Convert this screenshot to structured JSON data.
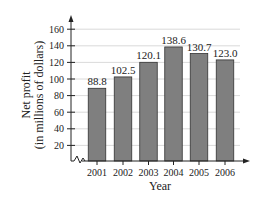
{
  "chart_data": {
    "type": "bar",
    "title": "",
    "xlabel": "Year",
    "ylabel": "Net profit (in millions of dollars)",
    "ylabel_lines": [
      "Net profit",
      "(in millions of dollars)"
    ],
    "categories": [
      "2001",
      "2002",
      "2003",
      "2004",
      "2005",
      "2006"
    ],
    "values": [
      88.8,
      102.5,
      120.1,
      138.6,
      130.7,
      123.0
    ],
    "value_labels": [
      "88.8",
      "102.5",
      "120.1",
      "138.6",
      "130.7",
      "123.0"
    ],
    "yticks": [
      20,
      40,
      60,
      80,
      100,
      120,
      140,
      160
    ],
    "ytick_labels": [
      "20",
      "40",
      "60",
      "80",
      "100",
      "120",
      "140",
      "160"
    ],
    "ylim": [
      0,
      170
    ],
    "grid": true,
    "axis_break": true,
    "legend": null,
    "colors": {
      "bar": "#7f7f7f",
      "bar_edge": "#333333",
      "grid": "#d0d0d0",
      "axis": "#222222"
    }
  }
}
